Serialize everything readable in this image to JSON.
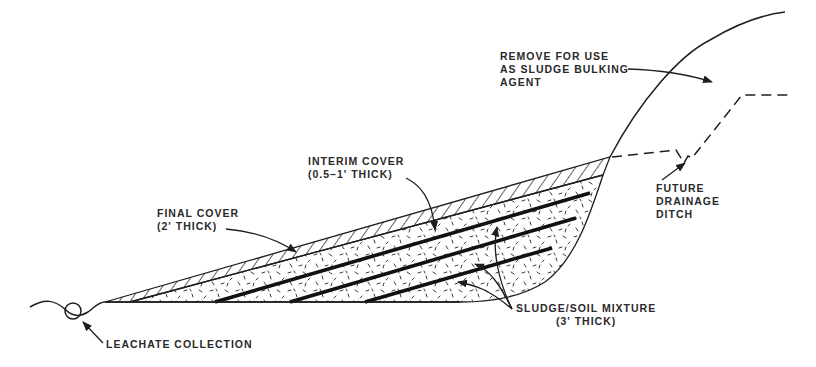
{
  "diagram": {
    "colors": {
      "ink": "#1e1e1e",
      "background": "#ffffff"
    },
    "labels": {
      "remove": {
        "line1": "REMOVE FOR USE",
        "line2": "AS SLUDGE BULKING",
        "line3": "AGENT"
      },
      "interim_cover": {
        "line1": "INTERIM COVER",
        "line2": "(0.5–1' THICK)"
      },
      "final_cover": {
        "line1": "FINAL COVER",
        "line2": "(2' THICK)"
      },
      "future_ditch": {
        "line1": "FUTURE",
        "line2": "DRAINAGE",
        "line3": "DITCH"
      },
      "sludge_soil": {
        "line1": "SLUDGE/SOIL MIXTURE",
        "line2": "(3' THICK)"
      },
      "leachate": {
        "line1": "LEACHATE COLLECTION"
      }
    },
    "layers": [
      {
        "name": "final-cover",
        "pattern": "diagonal-hatch"
      },
      {
        "name": "interim-cover",
        "pattern": "solid-black-line"
      },
      {
        "name": "sludge-soil-mixture",
        "pattern": "speckle",
        "count": 4
      }
    ]
  }
}
